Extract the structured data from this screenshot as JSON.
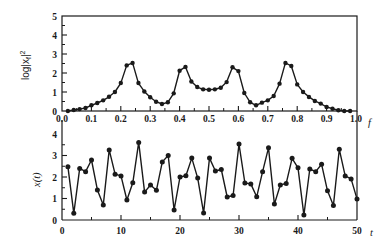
{
  "chart_data": [
    {
      "type": "line",
      "panel": "top",
      "title": "",
      "xlabel": "f",
      "ylabel": "log|x_f|²",
      "ylabel_main": "log|x",
      "ylabel_sub": "f",
      "ylabel_sup": "2",
      "xlim": [
        0.0,
        1.0
      ],
      "ylim": [
        0,
        5
      ],
      "xticks": [
        "0.0",
        "0.1",
        "0.2",
        "0.3",
        "0.4",
        "0.5",
        "0.6",
        "0.7",
        "0.8",
        "0.9",
        "1.0"
      ],
      "yticks": [
        "0",
        "1",
        "2",
        "3",
        "4",
        "5"
      ],
      "grid": false,
      "markers": true,
      "x": [
        0.02,
        0.04,
        0.06,
        0.08,
        0.1,
        0.12,
        0.14,
        0.16,
        0.18,
        0.2,
        0.22,
        0.24,
        0.26,
        0.28,
        0.3,
        0.32,
        0.34,
        0.36,
        0.38,
        0.4,
        0.42,
        0.44,
        0.46,
        0.48,
        0.5,
        0.52,
        0.54,
        0.56,
        0.58,
        0.6,
        0.62,
        0.64,
        0.66,
        0.68,
        0.7,
        0.72,
        0.74,
        0.76,
        0.78,
        0.8,
        0.82,
        0.84,
        0.86,
        0.88,
        0.9,
        0.92,
        0.94,
        0.96,
        0.98
      ],
      "values": [
        0.0,
        0.05,
        0.1,
        0.16,
        0.3,
        0.42,
        0.56,
        0.75,
        1.0,
        1.47,
        2.4,
        2.53,
        1.47,
        1.03,
        0.72,
        0.49,
        0.37,
        0.46,
        0.93,
        2.12,
        2.32,
        1.55,
        1.26,
        1.14,
        1.12,
        1.14,
        1.22,
        1.52,
        2.3,
        2.1,
        0.95,
        0.46,
        0.3,
        0.44,
        0.56,
        0.79,
        1.44,
        2.53,
        2.37,
        1.4,
        1.0,
        0.74,
        0.53,
        0.39,
        0.21,
        0.12,
        0.04,
        0.0,
        0.0
      ]
    },
    {
      "type": "line",
      "panel": "bottom",
      "title": "",
      "xlabel": "t",
      "ylabel": "x(t)",
      "xlim": [
        0,
        50
      ],
      "ylim": [
        0,
        4
      ],
      "xticks": [
        "0",
        "10",
        "20",
        "30",
        "40",
        "50"
      ],
      "yticks": [
        "0",
        "1",
        "2",
        "3",
        "4"
      ],
      "grid": false,
      "markers": true,
      "x": [
        1,
        2,
        3,
        4,
        5,
        6,
        7,
        8,
        9,
        10,
        11,
        12,
        13,
        14,
        15,
        16,
        17,
        18,
        19,
        20,
        21,
        22,
        23,
        24,
        25,
        26,
        27,
        28,
        29,
        30,
        31,
        32,
        33,
        34,
        35,
        36,
        37,
        38,
        39,
        40,
        41,
        42,
        43,
        44,
        45,
        46,
        47,
        48,
        49,
        50
      ],
      "values": [
        2.48,
        0.31,
        2.4,
        2.25,
        2.79,
        1.4,
        0.7,
        3.26,
        2.13,
        2.05,
        0.93,
        1.73,
        3.61,
        1.3,
        1.63,
        1.38,
        2.7,
        3.0,
        0.47,
        2.0,
        2.06,
        2.88,
        1.95,
        0.33,
        2.88,
        2.28,
        2.35,
        1.07,
        1.14,
        3.53,
        1.72,
        1.68,
        1.08,
        2.25,
        3.36,
        0.74,
        1.63,
        1.7,
        2.87,
        2.43,
        0.23,
        2.37,
        2.25,
        2.59,
        1.36,
        0.67,
        3.29,
        2.05,
        1.91,
        0.98
      ]
    }
  ],
  "colors": {
    "line": "#1a1a1a",
    "marker": "#1a1a1a",
    "axis": "#1a1a1a",
    "background": "#ffffff"
  }
}
